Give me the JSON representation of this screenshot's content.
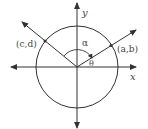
{
  "diagram": {
    "labels": {
      "y_axis": "y",
      "x_axis": "x",
      "point_left": "(c,d)",
      "point_right": "(a,b)",
      "angle_alpha": "α",
      "angle_theta": "θ"
    },
    "colors": {
      "stroke": "#333333",
      "text": "#444444",
      "background": "#ffffff"
    }
  }
}
